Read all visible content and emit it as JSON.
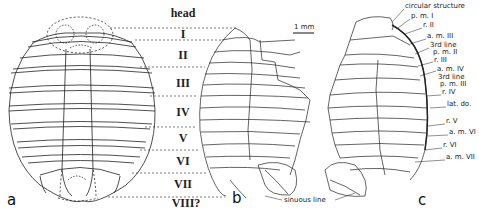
{
  "figure": {
    "panels": [
      {
        "id": "a",
        "letter": "a",
        "description": "schematic reconstruction"
      },
      {
        "id": "b",
        "letter": "b",
        "description": "camera lucida drawing, left view"
      },
      {
        "id": "c",
        "letter": "c",
        "description": "camera lucida drawing, right view"
      }
    ],
    "segment_labels": [
      {
        "label": "head",
        "y": 17
      },
      {
        "label": "I",
        "y": 35
      },
      {
        "label": "II",
        "y": 56
      },
      {
        "label": "III",
        "y": 84
      },
      {
        "label": "IV",
        "y": 114
      },
      {
        "label": "V",
        "y": 139
      },
      {
        "label": "VI",
        "y": 161
      },
      {
        "label": "VII",
        "y": 185
      },
      {
        "label": "VIII?",
        "y": 203
      }
    ],
    "scale_bar": {
      "label": "1 mm"
    },
    "annotations_c": [
      {
        "text": "circular structure",
        "x": 405,
        "y": 6
      },
      {
        "text": "p. m. I",
        "x": 411,
        "y": 16
      },
      {
        "text": "r. II",
        "x": 423,
        "y": 25
      },
      {
        "text": "a. m. III",
        "x": 427,
        "y": 36
      },
      {
        "text": "3rd line",
        "x": 430,
        "y": 45
      },
      {
        "text": "p. m. II",
        "x": 433,
        "y": 52
      },
      {
        "text": "r. III",
        "x": 434,
        "y": 60
      },
      {
        "text": "a. m. IV",
        "x": 437,
        "y": 69
      },
      {
        "text": "3rd line",
        "x": 438,
        "y": 77
      },
      {
        "text": "p. m. III",
        "x": 440,
        "y": 84
      },
      {
        "text": "r. IV",
        "x": 442,
        "y": 92
      },
      {
        "text": "lat. do.",
        "x": 447,
        "y": 104
      },
      {
        "text": "r. V",
        "x": 446,
        "y": 121
      },
      {
        "text": "a. m. VI",
        "x": 449,
        "y": 132
      },
      {
        "text": "r. VI",
        "x": 443,
        "y": 145
      },
      {
        "text": "a. m. VII",
        "x": 446,
        "y": 157
      }
    ],
    "annotation_b": {
      "text": "sinuous line"
    }
  }
}
